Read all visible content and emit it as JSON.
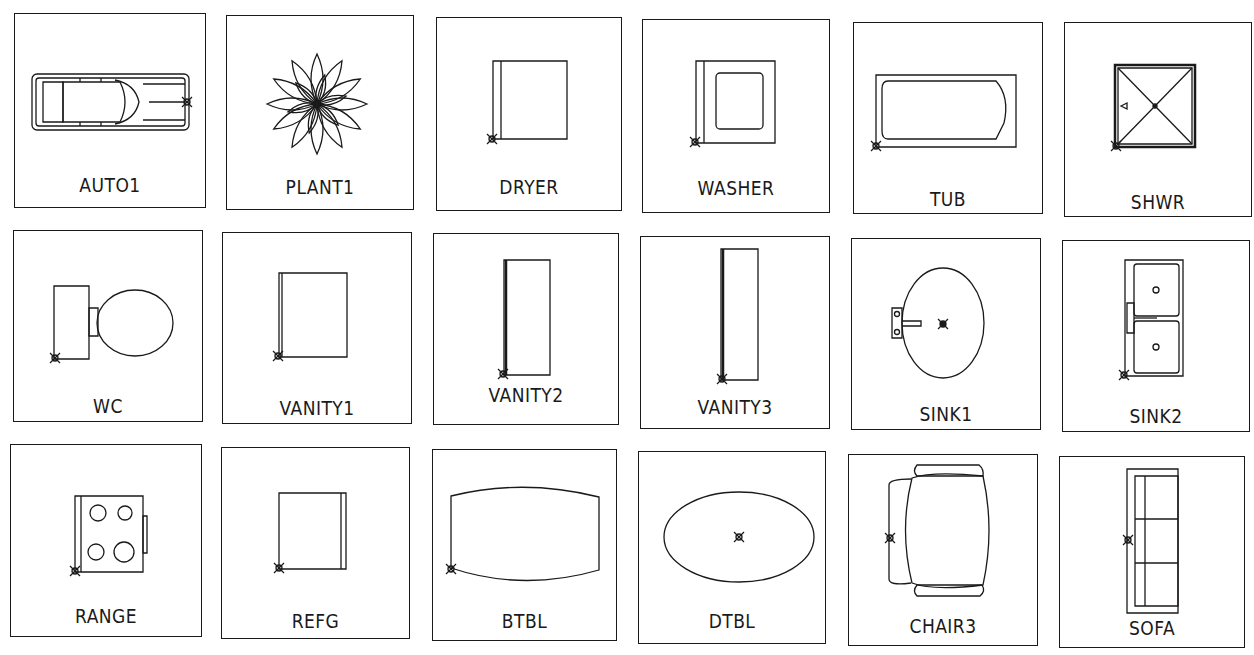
{
  "palette": {
    "line": "#1a1a1a",
    "background": "#ffffff"
  },
  "blocks": [
    {
      "id": "auto1",
      "label": "AUTO1",
      "icon": "car-icon"
    },
    {
      "id": "plant1",
      "label": "PLANT1",
      "icon": "plant-icon"
    },
    {
      "id": "dryer",
      "label": "DRYER",
      "icon": "dryer-icon"
    },
    {
      "id": "washer",
      "label": "WASHER",
      "icon": "washer-icon"
    },
    {
      "id": "tub",
      "label": "TUB",
      "icon": "bathtub-icon"
    },
    {
      "id": "shwr",
      "label": "SHWR",
      "icon": "shower-icon"
    },
    {
      "id": "wc",
      "label": "WC",
      "icon": "toilet-icon"
    },
    {
      "id": "vanity1",
      "label": "VANITY1",
      "icon": "vanity-icon"
    },
    {
      "id": "vanity2",
      "label": "VANITY2",
      "icon": "vanity-icon"
    },
    {
      "id": "vanity3",
      "label": "VANITY3",
      "icon": "vanity-icon"
    },
    {
      "id": "sink1",
      "label": "SINK1",
      "icon": "sink-icon"
    },
    {
      "id": "sink2",
      "label": "SINK2",
      "icon": "double-sink-icon"
    },
    {
      "id": "range",
      "label": "RANGE",
      "icon": "range-icon"
    },
    {
      "id": "refg",
      "label": "REFG",
      "icon": "refrigerator-icon"
    },
    {
      "id": "btbl",
      "label": "BTBL",
      "icon": "barrel-table-icon"
    },
    {
      "id": "dtbl",
      "label": "DTBL",
      "icon": "dining-table-icon"
    },
    {
      "id": "chair3",
      "label": "CHAIR3",
      "icon": "chair-icon"
    },
    {
      "id": "sofa",
      "label": "SOFA",
      "icon": "sofa-icon"
    }
  ]
}
